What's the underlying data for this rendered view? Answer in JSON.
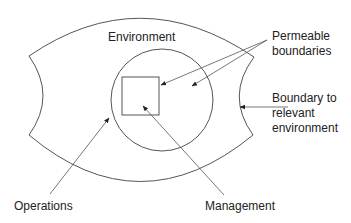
{
  "diagram": {
    "colors": {
      "stroke": "#555555",
      "text": "#222222",
      "background": "#ffffff"
    },
    "labels": {
      "environment": "Environment",
      "permeable_line1": "Permeable",
      "permeable_line2": "boundaries",
      "boundary_line1": "Boundary to",
      "boundary_line2": "relevant",
      "boundary_line3": "environment",
      "operations": "Operations",
      "management": "Management"
    },
    "shapes": {
      "outer": "Boundary to relevant environment (curved enclosure)",
      "circle": "Operations",
      "square": "Management"
    }
  }
}
